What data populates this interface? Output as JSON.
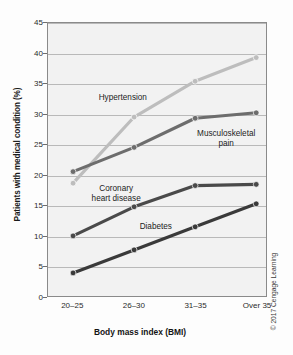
{
  "chart_data": {
    "type": "line",
    "title": "",
    "xlabel": "Body mass index (BMI)",
    "ylabel": "Patients with medical condition (%)",
    "categories": [
      "20–25",
      "26–30",
      "31–35",
      "Over 35"
    ],
    "ylim": [
      0,
      45
    ],
    "yticks": [
      0,
      5,
      10,
      15,
      20,
      25,
      30,
      35,
      40,
      45
    ],
    "ytick_labels": [
      "0",
      "5",
      "10",
      "15",
      "20",
      "25",
      "30",
      "35",
      "40",
      "45"
    ],
    "grid": true,
    "legend_position": "inline-annotations",
    "series": [
      {
        "name": "Hypertension",
        "values": [
          18.6,
          29.5,
          35.4,
          39.3
        ],
        "color": "#bdbdbd"
      },
      {
        "name": "Musculoskeletal pain",
        "values": [
          20.5,
          24.5,
          29.3,
          30.2
        ],
        "color": "#6d6d6d"
      },
      {
        "name": "Coronary heart disease",
        "values": [
          9.9,
          14.7,
          18.2,
          18.4
        ],
        "color": "#4a4a4a"
      },
      {
        "name": "Diabetes",
        "values": [
          3.8,
          7.6,
          11.4,
          15.2
        ],
        "color": "#3a3a3a"
      }
    ],
    "annotations": [
      {
        "text": "Hypertension",
        "x_frac": 0.34,
        "y_value": 32.6
      },
      {
        "text_line1": "Musculoskeletal",
        "text_line2": "pain",
        "x_frac": 0.81,
        "y_value": 26.6
      },
      {
        "text_line1": "Coronary",
        "text_line2": "heart disease",
        "x_frac": 0.31,
        "y_value": 17.6
      },
      {
        "text": "Diabetes",
        "x_frac": 0.49,
        "y_value": 11.4
      }
    ]
  },
  "annotation_labels": {
    "hypertension": "Hypertension",
    "musculoskeletal_line1": "Musculoskeletal",
    "musculoskeletal_line2": "pain",
    "coronary_line1": "Coronary",
    "coronary_line2": "heart disease",
    "diabetes": "Diabetes"
  },
  "axes": {
    "x_title": "Body mass index (BMI)",
    "y_title": "Patients with medical condition (%)",
    "x_tick_labels": [
      "20–25",
      "26–30",
      "31–35",
      "Over 35"
    ],
    "y_tick_labels": [
      "45",
      "40",
      "35",
      "30",
      "25",
      "20",
      "15",
      "10",
      "5",
      "0"
    ]
  },
  "footer": {
    "copyright": "© 2017 Cengage Learning"
  },
  "colors": {
    "hypertension": "#bdbdbd",
    "musculoskeletal": "#6d6d6d",
    "coronary": "#4a4a4a",
    "diabetes": "#3a3a3a",
    "plot_background": "#f2f2f2",
    "gridline": "#b9b9b9",
    "frame": "#8a8a8a"
  }
}
